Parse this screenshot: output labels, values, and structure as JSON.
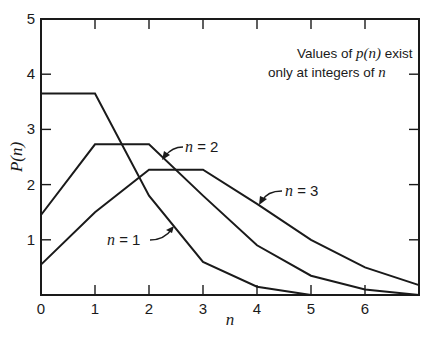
{
  "chart_data": {
    "type": "line",
    "title": "",
    "xlabel": "n",
    "ylabel": "P(n)",
    "xlim": [
      0,
      7
    ],
    "ylim": [
      0,
      5
    ],
    "x_ticks": [
      0,
      1,
      2,
      3,
      4,
      5,
      6
    ],
    "y_ticks": [
      1,
      2,
      3,
      4,
      5
    ],
    "x_tick_labels": [
      "0",
      "1",
      "2",
      "3",
      "4",
      "5",
      "6"
    ],
    "y_tick_labels": [
      "1",
      "2",
      "3",
      "4",
      "5"
    ],
    "grid": false,
    "x": [
      0,
      1,
      2,
      3,
      4,
      5,
      6,
      7
    ],
    "series": [
      {
        "name": "n = 1",
        "values": [
          3.65,
          3.65,
          1.8,
          0.6,
          0.15,
          0.0,
          0.0,
          0.0
        ]
      },
      {
        "name": "n = 2",
        "values": [
          1.45,
          2.73,
          2.73,
          1.8,
          0.9,
          0.35,
          0.1,
          0.0
        ]
      },
      {
        "name": "n = 3",
        "values": [
          0.55,
          1.5,
          2.27,
          2.27,
          1.65,
          1.0,
          0.5,
          0.18
        ]
      }
    ],
    "annotations": [
      {
        "text_parts": [
          "Values of ",
          "p(n)",
          " exist"
        ]
      },
      {
        "text_parts": [
          "only at integers of ",
          "n"
        ]
      }
    ],
    "series_labels": [
      {
        "var": "n",
        "eq": " = 1"
      },
      {
        "var": "n",
        "eq": " = 2"
      },
      {
        "var": "n",
        "eq": " = 3"
      }
    ]
  }
}
